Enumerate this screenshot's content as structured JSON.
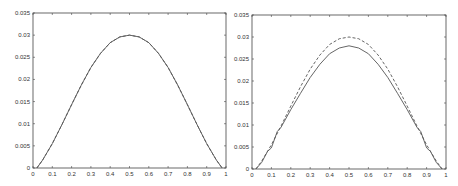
{
  "chart_data": [
    {
      "type": "line",
      "title": "",
      "xlabel": "",
      "ylabel": "",
      "xlim": [
        0,
        1
      ],
      "ylim": [
        0,
        0.035
      ],
      "grid": false,
      "legend": null,
      "xticks": [
        "0",
        "0.1",
        "0.2",
        "0.3",
        "0.4",
        "0.5",
        "0.6",
        "0.7",
        "0.8",
        "0.9",
        "1"
      ],
      "yticks": [
        "0",
        "0.005",
        "0.01",
        "0.015",
        "0.02",
        "0.025",
        "0.03",
        "0.035"
      ],
      "series": [
        {
          "name": "solid",
          "style": "solid",
          "x": [
            0.02,
            0.05,
            0.1,
            0.15,
            0.2,
            0.25,
            0.3,
            0.35,
            0.4,
            0.45,
            0.5,
            0.55,
            0.6,
            0.65,
            0.7,
            0.75,
            0.8,
            0.85,
            0.9,
            0.95,
            0.98
          ],
          "y": [
            0.0,
            0.0018,
            0.0055,
            0.0098,
            0.0143,
            0.0187,
            0.0227,
            0.0259,
            0.0283,
            0.0296,
            0.03,
            0.0296,
            0.0283,
            0.0259,
            0.0227,
            0.0187,
            0.0143,
            0.0098,
            0.0055,
            0.0018,
            0.0
          ]
        },
        {
          "name": "dashed",
          "style": "dashed",
          "x": [
            0.02,
            0.05,
            0.1,
            0.15,
            0.2,
            0.25,
            0.3,
            0.35,
            0.4,
            0.45,
            0.5,
            0.55,
            0.6,
            0.65,
            0.7,
            0.75,
            0.8,
            0.85,
            0.9,
            0.95,
            0.98
          ],
          "y": [
            0.0,
            0.0018,
            0.0055,
            0.0098,
            0.0143,
            0.0187,
            0.0227,
            0.0259,
            0.0283,
            0.0296,
            0.03,
            0.0296,
            0.0283,
            0.0259,
            0.0227,
            0.0187,
            0.0143,
            0.0098,
            0.0055,
            0.0018,
            0.0
          ]
        }
      ]
    },
    {
      "type": "line",
      "title": "",
      "xlabel": "",
      "ylabel": "",
      "xlim": [
        0,
        1
      ],
      "ylim": [
        0,
        0.035
      ],
      "grid": false,
      "legend": null,
      "xticks": [
        "0",
        "0.1",
        "0.2",
        "0.3",
        "0.4",
        "0.5",
        "0.6",
        "0.7",
        "0.8",
        "0.9",
        "1"
      ],
      "yticks": [
        "0",
        "0.005",
        "0.01",
        "0.015",
        "0.02",
        "0.025",
        "0.03",
        "0.035"
      ],
      "series": [
        {
          "name": "solid",
          "style": "solid",
          "x": [
            0.02,
            0.05,
            0.08,
            0.1,
            0.13,
            0.15,
            0.2,
            0.25,
            0.3,
            0.35,
            0.4,
            0.45,
            0.5,
            0.55,
            0.6,
            0.65,
            0.7,
            0.75,
            0.8,
            0.85,
            0.87,
            0.9,
            0.92,
            0.95,
            0.98
          ],
          "y": [
            0.0,
            0.0015,
            0.004,
            0.0048,
            0.0085,
            0.0095,
            0.0135,
            0.0172,
            0.0208,
            0.0238,
            0.0262,
            0.0275,
            0.028,
            0.0275,
            0.0262,
            0.0238,
            0.0208,
            0.0172,
            0.0135,
            0.0095,
            0.0085,
            0.0048,
            0.004,
            0.0015,
            0.0
          ]
        },
        {
          "name": "dashed",
          "style": "dashed",
          "x": [
            0.02,
            0.05,
            0.1,
            0.15,
            0.2,
            0.25,
            0.3,
            0.35,
            0.4,
            0.45,
            0.5,
            0.55,
            0.6,
            0.65,
            0.7,
            0.75,
            0.8,
            0.85,
            0.9,
            0.95,
            0.98
          ],
          "y": [
            0.0,
            0.0018,
            0.0055,
            0.0098,
            0.0143,
            0.0187,
            0.0227,
            0.0259,
            0.0283,
            0.0296,
            0.03,
            0.0296,
            0.0283,
            0.0259,
            0.0227,
            0.0187,
            0.0143,
            0.0098,
            0.0055,
            0.0018,
            0.0
          ]
        }
      ]
    }
  ],
  "colors": {
    "line": "#555555",
    "axis": "#444444",
    "text": "#333333"
  }
}
